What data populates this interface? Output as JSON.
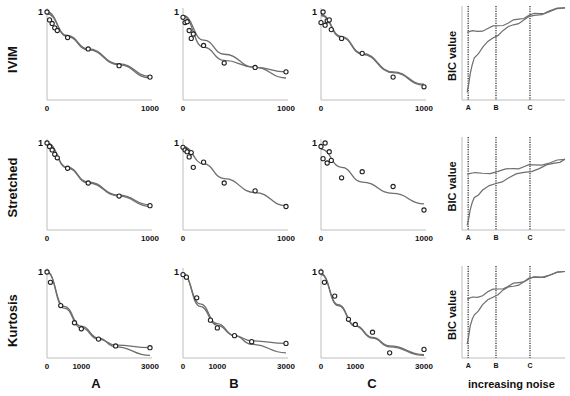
{
  "figure": {
    "row_labels": [
      "IVIM",
      "Stretched",
      "Kurtosis"
    ],
    "column_labels": [
      "A",
      "B",
      "C"
    ],
    "bic_panel": {
      "ylabel": "BIC value",
      "xlabel": "increasing noise",
      "markers": [
        "A",
        "B",
        "C"
      ]
    },
    "colors": {
      "axis": "#bdbdbd",
      "curve": "#6e6e6e",
      "marker": "#222222",
      "dotted": "#333333",
      "text": "#111111"
    }
  },
  "chart_data": [
    {
      "panel": "IVIM-A",
      "type": "scatter",
      "ytick": "1",
      "xticks": [
        "0",
        "1000"
      ],
      "xlim": [
        0,
        1000
      ],
      "ylim": [
        0,
        1
      ],
      "points": [
        [
          0,
          1.0
        ],
        [
          25,
          0.91
        ],
        [
          50,
          0.87
        ],
        [
          75,
          0.82
        ],
        [
          100,
          0.79
        ],
        [
          200,
          0.71
        ],
        [
          400,
          0.58
        ],
        [
          700,
          0.39
        ],
        [
          1000,
          0.26
        ]
      ],
      "fits": [
        [
          [
            0,
            1.0
          ],
          [
            200,
            0.72
          ],
          [
            400,
            0.57
          ],
          [
            700,
            0.4
          ],
          [
            1000,
            0.25
          ]
        ],
        [
          [
            0,
            0.98
          ],
          [
            200,
            0.73
          ],
          [
            400,
            0.58
          ],
          [
            700,
            0.41
          ],
          [
            1000,
            0.27
          ]
        ]
      ]
    },
    {
      "panel": "IVIM-B",
      "type": "scatter",
      "ytick": "1",
      "xticks": [
        "0",
        "1000"
      ],
      "xlim": [
        0,
        1000
      ],
      "ylim": [
        0,
        1
      ],
      "points": [
        [
          0,
          0.94
        ],
        [
          20,
          0.88
        ],
        [
          40,
          0.89
        ],
        [
          60,
          0.79
        ],
        [
          80,
          0.7
        ],
        [
          100,
          0.75
        ],
        [
          200,
          0.62
        ],
        [
          400,
          0.42
        ],
        [
          700,
          0.37
        ],
        [
          1000,
          0.32
        ]
      ],
      "fits": [
        [
          [
            0,
            0.96
          ],
          [
            200,
            0.68
          ],
          [
            400,
            0.52
          ],
          [
            700,
            0.37
          ],
          [
            1000,
            0.25
          ]
        ],
        [
          [
            0,
            0.95
          ],
          [
            200,
            0.6
          ],
          [
            400,
            0.45
          ],
          [
            700,
            0.37
          ],
          [
            1000,
            0.32
          ]
        ]
      ]
    },
    {
      "panel": "IVIM-C",
      "type": "scatter",
      "ytick": "1",
      "xticks": [
        "0",
        "1000"
      ],
      "xlim": [
        0,
        1000
      ],
      "ylim": [
        0,
        1
      ],
      "points": [
        [
          0,
          0.88
        ],
        [
          20,
          1.0
        ],
        [
          40,
          0.85
        ],
        [
          60,
          0.9
        ],
        [
          80,
          0.91
        ],
        [
          100,
          0.8
        ],
        [
          200,
          0.7
        ],
        [
          400,
          0.53
        ],
        [
          700,
          0.26
        ],
        [
          1000,
          0.15
        ]
      ],
      "fits": [
        [
          [
            0,
            0.97
          ],
          [
            200,
            0.72
          ],
          [
            400,
            0.53
          ],
          [
            700,
            0.32
          ],
          [
            1000,
            0.18
          ]
        ],
        [
          [
            0,
            0.96
          ],
          [
            200,
            0.71
          ],
          [
            400,
            0.52
          ],
          [
            700,
            0.31
          ],
          [
            1000,
            0.17
          ]
        ]
      ]
    },
    {
      "panel": "Stretched-A",
      "type": "scatter",
      "ytick": "1",
      "xticks": [
        "0",
        "1000"
      ],
      "xlim": [
        0,
        1000
      ],
      "ylim": [
        0,
        1
      ],
      "points": [
        [
          0,
          1.0
        ],
        [
          25,
          0.96
        ],
        [
          50,
          0.92
        ],
        [
          75,
          0.87
        ],
        [
          100,
          0.83
        ],
        [
          200,
          0.71
        ],
        [
          400,
          0.54
        ],
        [
          700,
          0.39
        ],
        [
          1000,
          0.28
        ]
      ],
      "fits": [
        [
          [
            0,
            1.0
          ],
          [
            200,
            0.72
          ],
          [
            400,
            0.55
          ],
          [
            700,
            0.4
          ],
          [
            1000,
            0.29
          ]
        ],
        [
          [
            0,
            0.99
          ],
          [
            200,
            0.71
          ],
          [
            400,
            0.54
          ],
          [
            700,
            0.39
          ],
          [
            1000,
            0.27
          ]
        ]
      ]
    },
    {
      "panel": "Stretched-B",
      "type": "scatter",
      "ytick": "1",
      "xticks": [
        "0",
        "1000"
      ],
      "xlim": [
        0,
        1000
      ],
      "ylim": [
        0,
        1
      ],
      "points": [
        [
          0,
          0.95
        ],
        [
          20,
          0.92
        ],
        [
          40,
          0.9
        ],
        [
          60,
          0.84
        ],
        [
          80,
          0.89
        ],
        [
          100,
          0.72
        ],
        [
          200,
          0.78
        ],
        [
          400,
          0.54
        ],
        [
          700,
          0.45
        ],
        [
          1000,
          0.27
        ]
      ],
      "fits": [
        [
          [
            0,
            0.96
          ],
          [
            200,
            0.76
          ],
          [
            400,
            0.59
          ],
          [
            700,
            0.43
          ],
          [
            1000,
            0.28
          ]
        ]
      ]
    },
    {
      "panel": "Stretched-C",
      "type": "scatter",
      "ytick": "1",
      "xticks": [
        "0",
        "1000"
      ],
      "xlim": [
        0,
        1000
      ],
      "ylim": [
        0,
        1
      ],
      "points": [
        [
          0,
          0.96
        ],
        [
          20,
          0.82
        ],
        [
          40,
          1.0
        ],
        [
          60,
          0.77
        ],
        [
          80,
          0.9
        ],
        [
          100,
          0.8
        ],
        [
          200,
          0.6
        ],
        [
          400,
          0.67
        ],
        [
          700,
          0.5
        ],
        [
          1000,
          0.23
        ]
      ],
      "fits": [
        [
          [
            0,
            0.93
          ],
          [
            200,
            0.72
          ],
          [
            400,
            0.55
          ],
          [
            700,
            0.42
          ],
          [
            1000,
            0.3
          ]
        ]
      ]
    },
    {
      "panel": "Kurtosis-A",
      "type": "scatter",
      "ytick": "1",
      "xticks": [
        "0",
        "1000",
        "3000"
      ],
      "xlim": [
        0,
        3000
      ],
      "ylim": [
        0,
        1
      ],
      "points": [
        [
          0,
          1.0
        ],
        [
          100,
          0.88
        ],
        [
          400,
          0.61
        ],
        [
          800,
          0.41
        ],
        [
          1000,
          0.34
        ],
        [
          1500,
          0.22
        ],
        [
          2000,
          0.14
        ],
        [
          3000,
          0.12
        ]
      ],
      "fits": [
        [
          [
            0,
            1.0
          ],
          [
            500,
            0.58
          ],
          [
            1000,
            0.35
          ],
          [
            1500,
            0.22
          ],
          [
            2000,
            0.15
          ],
          [
            3000,
            0.12
          ]
        ],
        [
          [
            0,
            1.0
          ],
          [
            500,
            0.6
          ],
          [
            1000,
            0.37
          ],
          [
            1500,
            0.23
          ],
          [
            2000,
            0.13
          ],
          [
            3000,
            0.03
          ]
        ]
      ]
    },
    {
      "panel": "Kurtosis-B",
      "type": "scatter",
      "ytick": "1",
      "xticks": [
        "0",
        "1000",
        "3000"
      ],
      "xlim": [
        0,
        3000
      ],
      "ylim": [
        0,
        1
      ],
      "points": [
        [
          0,
          0.97
        ],
        [
          100,
          0.94
        ],
        [
          400,
          0.7
        ],
        [
          800,
          0.44
        ],
        [
          1000,
          0.35
        ],
        [
          1500,
          0.26
        ],
        [
          2000,
          0.19
        ],
        [
          3000,
          0.17
        ]
      ],
      "fits": [
        [
          [
            0,
            0.98
          ],
          [
            500,
            0.6
          ],
          [
            1000,
            0.38
          ],
          [
            1500,
            0.26
          ],
          [
            2000,
            0.2
          ],
          [
            3000,
            0.17
          ]
        ],
        [
          [
            0,
            0.97
          ],
          [
            500,
            0.63
          ],
          [
            1000,
            0.4
          ],
          [
            1500,
            0.26
          ],
          [
            2000,
            0.16
          ],
          [
            3000,
            0.06
          ]
        ]
      ]
    },
    {
      "panel": "Kurtosis-C",
      "type": "scatter",
      "ytick": "1",
      "xticks": [
        "0",
        "1000",
        "3000"
      ],
      "xlim": [
        0,
        3000
      ],
      "ylim": [
        0,
        1
      ],
      "points": [
        [
          0,
          1.0
        ],
        [
          100,
          0.88
        ],
        [
          400,
          0.72
        ],
        [
          800,
          0.45
        ],
        [
          1000,
          0.39
        ],
        [
          1500,
          0.3
        ],
        [
          2000,
          0.06
        ],
        [
          3000,
          0.1
        ]
      ],
      "fits": [
        [
          [
            0,
            0.98
          ],
          [
            500,
            0.62
          ],
          [
            1000,
            0.38
          ],
          [
            1500,
            0.24
          ],
          [
            2000,
            0.14
          ],
          [
            3000,
            0.04
          ]
        ],
        [
          [
            0,
            0.97
          ],
          [
            500,
            0.61
          ],
          [
            1000,
            0.37
          ],
          [
            1500,
            0.23
          ],
          [
            2000,
            0.13
          ],
          [
            3000,
            0.03
          ]
        ]
      ]
    },
    {
      "panel": "IVIM-BIC",
      "type": "line",
      "ylabel": "BIC value",
      "xlabel": "increasing noise",
      "markers": [
        "A",
        "B",
        "C"
      ],
      "marker_positions": [
        0.06,
        0.33,
        0.66
      ],
      "series": [
        {
          "name": "model 1",
          "x": [
            0.05,
            0.15,
            0.25,
            0.35,
            0.45,
            0.55,
            0.65,
            0.75,
            0.85,
            1.0
          ],
          "y": [
            0.72,
            0.73,
            0.76,
            0.79,
            0.82,
            0.86,
            0.9,
            0.92,
            0.95,
            0.98
          ]
        },
        {
          "name": "model 2",
          "x": [
            0.05,
            0.08,
            0.12,
            0.2,
            0.3,
            0.4,
            0.5,
            0.6,
            0.7,
            0.85,
            1.0
          ],
          "y": [
            0.08,
            0.28,
            0.45,
            0.56,
            0.66,
            0.74,
            0.8,
            0.85,
            0.9,
            0.94,
            0.98
          ]
        }
      ]
    },
    {
      "panel": "Stretched-BIC",
      "type": "line",
      "ylabel": "BIC value",
      "xlabel": "increasing noise",
      "markers": [
        "A",
        "B",
        "C"
      ],
      "marker_positions": [
        0.06,
        0.33,
        0.66
      ],
      "series": [
        {
          "name": "model 1",
          "x": [
            0.05,
            0.2,
            0.35,
            0.5,
            0.6,
            0.7,
            0.85,
            1.0
          ],
          "y": [
            0.6,
            0.61,
            0.63,
            0.66,
            0.68,
            0.7,
            0.72,
            0.76
          ]
        },
        {
          "name": "model 2",
          "x": [
            0.05,
            0.08,
            0.12,
            0.2,
            0.33,
            0.45,
            0.6,
            0.75,
            0.9,
            1.0
          ],
          "y": [
            0.05,
            0.22,
            0.35,
            0.43,
            0.5,
            0.56,
            0.62,
            0.66,
            0.72,
            0.76
          ]
        }
      ]
    },
    {
      "panel": "Kurtosis-BIC",
      "type": "line",
      "ylabel": "BIC value",
      "xlabel": "increasing noise",
      "markers": [
        "A",
        "B",
        "C"
      ],
      "marker_positions": [
        0.06,
        0.33,
        0.66
      ],
      "series": [
        {
          "name": "model 1",
          "x": [
            0.05,
            0.15,
            0.25,
            0.35,
            0.45,
            0.55,
            0.65,
            0.75,
            0.85,
            1.0
          ],
          "y": [
            0.64,
            0.66,
            0.72,
            0.75,
            0.78,
            0.82,
            0.86,
            0.88,
            0.9,
            0.94
          ]
        },
        {
          "name": "model 2",
          "x": [
            0.05,
            0.08,
            0.12,
            0.2,
            0.3,
            0.4,
            0.5,
            0.6,
            0.7,
            0.85,
            1.0
          ],
          "y": [
            0.15,
            0.35,
            0.47,
            0.58,
            0.66,
            0.74,
            0.78,
            0.83,
            0.88,
            0.9,
            0.94
          ]
        }
      ]
    }
  ]
}
